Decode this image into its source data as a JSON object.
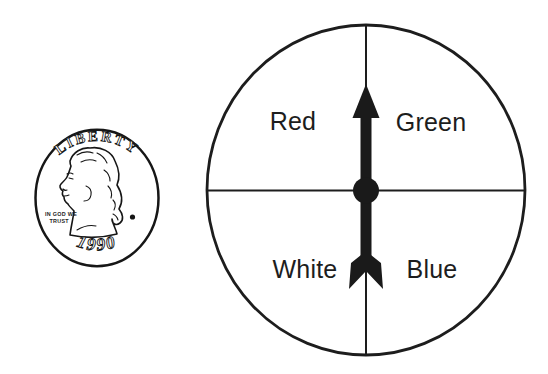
{
  "figure": {
    "background_color": "#ffffff",
    "ink_color": "#1d1d1d"
  },
  "coin": {
    "inscription": "LIBERTY",
    "motto_line1": "IN GOD WE",
    "motto_line2": "TRUST",
    "year": "1990"
  },
  "spinner": {
    "pointer_direction": "up",
    "sections": [
      {
        "label": "Red",
        "position": "top-left"
      },
      {
        "label": "Green",
        "position": "top-right"
      },
      {
        "label": "White",
        "position": "bottom-left"
      },
      {
        "label": "Blue",
        "position": "bottom-right"
      }
    ]
  }
}
